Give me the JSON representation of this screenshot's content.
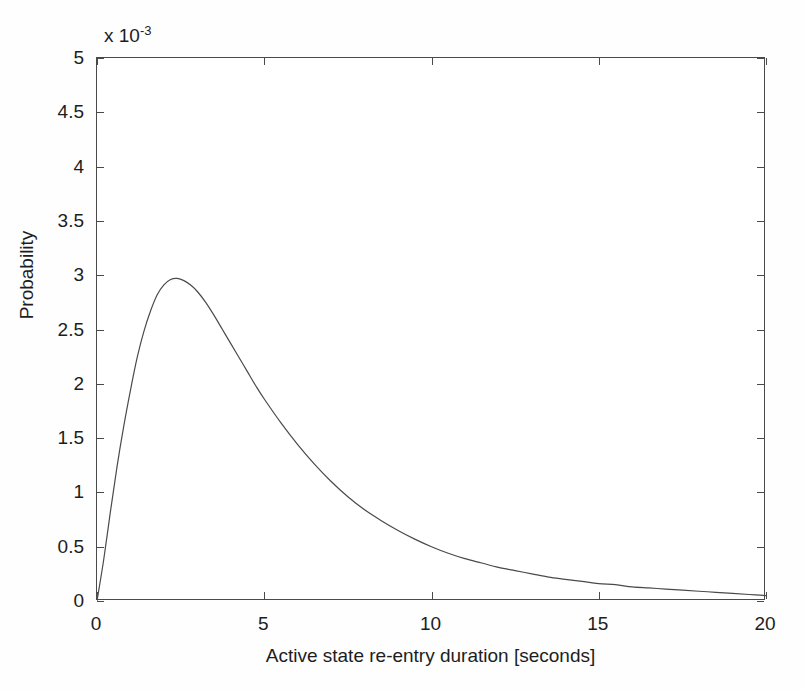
{
  "chart_data": {
    "type": "line",
    "title": "",
    "xlabel": "Active state re-entry duration [seconds]",
    "ylabel": "Probability",
    "y_exponent_prefix": "x 10",
    "y_exponent_value": "-3",
    "xlim": [
      0,
      20
    ],
    "ylim": [
      0,
      5
    ],
    "xticks": [
      0,
      5,
      10,
      15,
      20
    ],
    "xtick_labels": [
      "0",
      "5",
      "10",
      "15",
      "20"
    ],
    "yticks": [
      0,
      0.5,
      1,
      1.5,
      2,
      2.5,
      3,
      3.5,
      4,
      4.5,
      5
    ],
    "ytick_labels": [
      "0",
      "0.5",
      "1",
      "1.5",
      "2",
      "2.5",
      "3",
      "3.5",
      "4",
      "4.5",
      "5"
    ],
    "grid": false,
    "legend": "none",
    "line_color": "#4a4a4a",
    "line_width": 1.2,
    "axis_color": "#4a4a4a",
    "background_color": "#ffffff",
    "peak": {
      "x": 2.36,
      "y": 2.97
    },
    "series": [
      {
        "name": "Active state re-entry duration probability",
        "x": [
          0,
          0.2,
          0.4,
          0.6,
          0.8,
          1.0,
          1.2,
          1.4,
          1.6,
          1.8,
          2.0,
          2.2,
          2.4,
          2.6,
          2.8,
          3.0,
          3.25,
          3.5,
          3.75,
          4.0,
          4.25,
          4.5,
          4.75,
          5.0,
          5.5,
          6.0,
          6.5,
          7.0,
          7.5,
          8.0,
          8.5,
          9.0,
          9.5,
          10.0,
          10.5,
          11.0,
          11.5,
          12.0,
          12.5,
          13.0,
          13.5,
          14.0,
          14.5,
          15.0,
          15.5,
          16.0,
          16.5,
          17.0,
          17.5,
          18.0,
          18.5,
          19.0,
          19.5,
          20.0
        ],
        "y": [
          0.0,
          0.38,
          0.82,
          1.24,
          1.61,
          1.94,
          2.24,
          2.48,
          2.67,
          2.82,
          2.91,
          2.96,
          2.97,
          2.95,
          2.91,
          2.85,
          2.75,
          2.63,
          2.5,
          2.37,
          2.24,
          2.11,
          1.98,
          1.86,
          1.64,
          1.44,
          1.26,
          1.1,
          0.96,
          0.84,
          0.74,
          0.65,
          0.57,
          0.5,
          0.44,
          0.39,
          0.35,
          0.31,
          0.28,
          0.25,
          0.22,
          0.2,
          0.18,
          0.16,
          0.15,
          0.13,
          0.12,
          0.11,
          0.1,
          0.09,
          0.08,
          0.07,
          0.06,
          0.05
        ]
      }
    ]
  }
}
